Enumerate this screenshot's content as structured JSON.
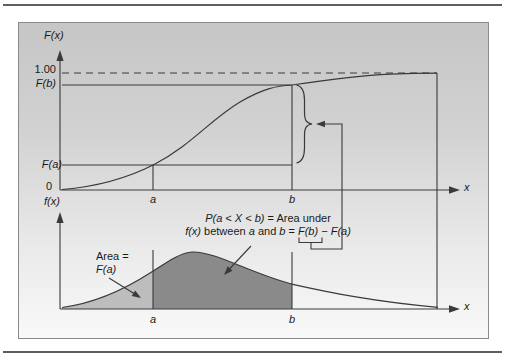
{
  "colors": {
    "line": "#3a3a3a",
    "light_area": "#bdbdbd",
    "dark_area": "#8a8a8a",
    "figure_background_top": "#c6c6c6",
    "figure_background_bottom": "#f9f9f9",
    "figure_border": "#8a8a8a",
    "rule": "#5f5f5f"
  },
  "top_chart": {
    "y_axis_label": "F(x)",
    "tick_one": "1.00",
    "tick_fb": "F(b)",
    "tick_fa": "F(a)",
    "origin_label": "0",
    "a_label": "a",
    "b_label": "b",
    "x_axis_label": "x"
  },
  "bottom_chart": {
    "y_axis_label": "f(x)",
    "a_label": "a",
    "b_label": "b",
    "x_axis_label": "x",
    "area_label_line1": "Area =",
    "area_label_line2": "F(a)"
  },
  "annotation": {
    "line1": [
      "P(a < X < b)",
      " = Area under"
    ],
    "line2": [
      "f(x)",
      " between ",
      "a",
      " and ",
      "b",
      " = ",
      "F(b) − F(a)"
    ]
  }
}
